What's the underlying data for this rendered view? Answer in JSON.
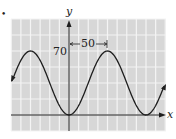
{
  "chart_data": {
    "type": "line",
    "title": "",
    "xlabel": "x",
    "ylabel": "y",
    "function": "y = 35 - 35cos(2*pi*x/100)",
    "series": [
      {
        "name": "sinusoid",
        "x": [
          -60,
          -50,
          -25,
          0,
          25,
          50,
          75,
          100,
          110
        ],
        "values": [
          10.8,
          70,
          35,
          0,
          35,
          70,
          35,
          0,
          10.8
        ]
      }
    ],
    "annotations": [
      {
        "text": "70",
        "meaning": "maximum y-value"
      },
      {
        "text": "50",
        "meaning": "horizontal distance from y-axis to peak"
      }
    ],
    "grid": true,
    "grid_step_x": 12.5,
    "grid_step_y": 17.5,
    "xlim": [
      -75,
      125
    ],
    "ylim": [
      -17.5,
      122.5
    ],
    "colors": {
      "background": "#d7d7d7",
      "grid": "#f2f2f2",
      "curve": "#1e1e1e",
      "axis": "#1e1e1e"
    }
  },
  "labels": {
    "bullet": "•",
    "y_axis": "y",
    "x_axis": "x",
    "max_value": "70",
    "half_period": "50"
  }
}
